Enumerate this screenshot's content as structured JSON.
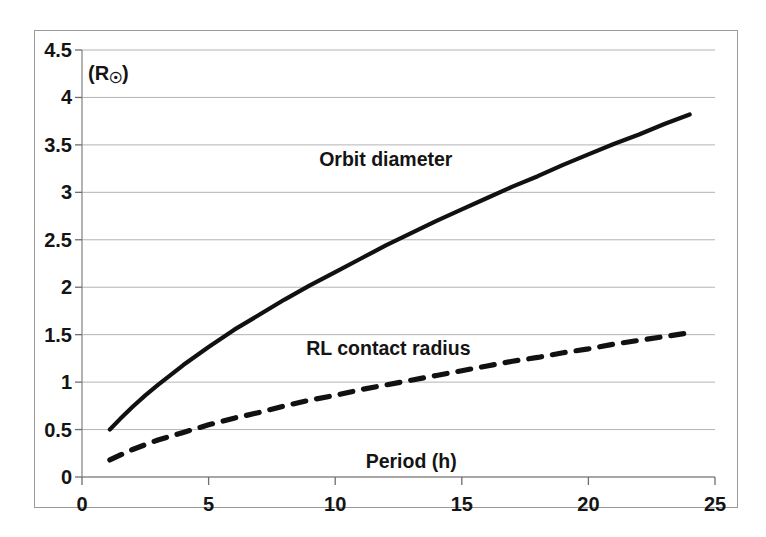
{
  "chart_data": {
    "type": "line",
    "title": "",
    "xlabel": "Period (h)",
    "ylabel": "(R☉)",
    "xlim": [
      0,
      25
    ],
    "ylim": [
      0,
      4.5
    ],
    "xticks": [
      "0",
      "5",
      "10",
      "15",
      "20",
      "25"
    ],
    "xtick_values": [
      0,
      5,
      10,
      15,
      20,
      25
    ],
    "yticks": [
      "0",
      "0.5",
      "1",
      "1.5",
      "2",
      "2.5",
      "3",
      "3.5",
      "4",
      "4.5"
    ],
    "ytick_values": [
      0,
      0.5,
      1,
      1.5,
      2,
      2.5,
      3,
      3.5,
      4,
      4.5
    ],
    "grid": "horizontal",
    "legend": "inline-annotations",
    "series": [
      {
        "name": "Orbit diameter",
        "style": "solid",
        "color": "#111111",
        "x": [
          1.1,
          1.5,
          2,
          2.5,
          3,
          4,
          5,
          6,
          7,
          8,
          9,
          10,
          11,
          12,
          13,
          14,
          15,
          16,
          17,
          18,
          19,
          20,
          21,
          22,
          23,
          24
        ],
        "y": [
          0.5,
          0.61,
          0.74,
          0.86,
          0.97,
          1.18,
          1.37,
          1.55,
          1.71,
          1.87,
          2.02,
          2.16,
          2.3,
          2.44,
          2.57,
          2.7,
          2.82,
          2.94,
          3.06,
          3.17,
          3.29,
          3.4,
          3.51,
          3.61,
          3.72,
          3.82
        ]
      },
      {
        "name": "RL contact radius",
        "style": "dashed",
        "color": "#111111",
        "x": [
          1.1,
          1.5,
          2,
          2.5,
          3,
          4,
          5,
          6,
          7,
          8,
          9,
          10,
          11,
          12,
          13,
          14,
          15,
          16,
          17,
          18,
          19,
          20,
          21,
          22,
          23,
          24
        ],
        "y": [
          0.18,
          0.23,
          0.29,
          0.34,
          0.39,
          0.47,
          0.55,
          0.62,
          0.68,
          0.75,
          0.81,
          0.86,
          0.92,
          0.97,
          1.02,
          1.07,
          1.12,
          1.17,
          1.22,
          1.26,
          1.31,
          1.35,
          1.4,
          1.44,
          1.48,
          1.52
        ]
      }
    ],
    "annotations": [
      {
        "text": "Orbit diameter",
        "x": 12.0,
        "y": 3.35
      },
      {
        "text": "RL contact radius",
        "x": 12.1,
        "y": 1.36
      },
      {
        "text": "Period (h)",
        "x": 13.0,
        "y": 0.17
      }
    ]
  },
  "axis": {
    "y_unit_label": "(R",
    "y_unit_symbol": "☉",
    "y_unit_close": ")"
  }
}
